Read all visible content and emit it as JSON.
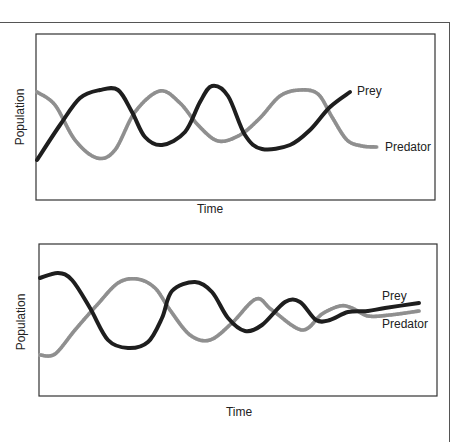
{
  "chart_data": [
    {
      "type": "line",
      "title": "",
      "xlabel": "Time",
      "ylabel": "Population",
      "grid": false,
      "legend": "inline-end-labels",
      "description": "Predator-prey cycles with constant amplitude oscillation",
      "series": [
        {
          "name": "Prey",
          "style": "solid-black",
          "points": [
            [
              37,
              160
            ],
            [
              60,
              125
            ],
            [
              80,
              98
            ],
            [
              100,
              90
            ],
            [
              118,
              90
            ],
            [
              132,
              112
            ],
            [
              145,
              137
            ],
            [
              162,
              145
            ],
            [
              185,
              132
            ],
            [
              200,
              102
            ],
            [
              212,
              86
            ],
            [
              228,
              96
            ],
            [
              245,
              135
            ],
            [
              262,
              149
            ],
            [
              290,
              145
            ],
            [
              310,
              130
            ],
            [
              330,
              107
            ],
            [
              350,
              92
            ]
          ]
        },
        {
          "name": "Predator",
          "style": "hatched-gray",
          "points": [
            [
              37,
              92
            ],
            [
              55,
              105
            ],
            [
              75,
              140
            ],
            [
              97,
              158
            ],
            [
              115,
              150
            ],
            [
              135,
              112
            ],
            [
              160,
              91
            ],
            [
              180,
              103
            ],
            [
              198,
              125
            ],
            [
              218,
              141
            ],
            [
              240,
              135
            ],
            [
              260,
              118
            ],
            [
              280,
              96
            ],
            [
              300,
              90
            ],
            [
              318,
              94
            ],
            [
              332,
              117
            ],
            [
              347,
              140
            ],
            [
              362,
              146
            ],
            [
              377,
              147
            ]
          ]
        }
      ],
      "labels": {
        "prey": {
          "text": "Prey",
          "x": 357,
          "y": 95
        },
        "predator": {
          "text": "Predator",
          "x": 385,
          "y": 151
        }
      },
      "box": {
        "x": 36,
        "y": 34,
        "w": 399,
        "h": 166
      },
      "xlabel_pos": {
        "x": 210,
        "y": 213
      },
      "ylabel_pos": {
        "x": 24,
        "y": 117
      }
    },
    {
      "type": "line",
      "title": "",
      "xlabel": "Time",
      "ylabel": "Population",
      "grid": false,
      "legend": "inline-end-labels",
      "description": "Predator-prey cycles with damped oscillation converging to equilibrium",
      "series": [
        {
          "name": "Prey",
          "style": "solid-black",
          "points": [
            [
              40,
              278
            ],
            [
              58,
              273
            ],
            [
              72,
              280
            ],
            [
              90,
              308
            ],
            [
              108,
              340
            ],
            [
              128,
              348
            ],
            [
              148,
              342
            ],
            [
              162,
              318
            ],
            [
              172,
              291
            ],
            [
              195,
              282
            ],
            [
              212,
              292
            ],
            [
              228,
              318
            ],
            [
              245,
              331
            ],
            [
              262,
              325
            ],
            [
              285,
              302
            ],
            [
              300,
              302
            ],
            [
              316,
              320
            ],
            [
              330,
              320
            ],
            [
              348,
              312
            ],
            [
              368,
              311
            ],
            [
              385,
              308
            ],
            [
              419,
              303
            ]
          ]
        },
        {
          "name": "Predator",
          "style": "hatched-gray",
          "points": [
            [
              40,
              355
            ],
            [
              55,
              354
            ],
            [
              75,
              330
            ],
            [
              97,
              305
            ],
            [
              118,
              283
            ],
            [
              137,
              279
            ],
            [
              155,
              288
            ],
            [
              170,
              310
            ],
            [
              190,
              335
            ],
            [
              210,
              340
            ],
            [
              232,
              323
            ],
            [
              256,
              299
            ],
            [
              272,
              310
            ],
            [
              302,
              330
            ],
            [
              322,
              314
            ],
            [
              340,
              306
            ],
            [
              352,
              308
            ],
            [
              368,
              316
            ],
            [
              390,
              315
            ],
            [
              419,
              311
            ]
          ]
        }
      ],
      "labels": {
        "prey": {
          "text": "Prey",
          "x": 382,
          "y": 300
        },
        "predator": {
          "text": "Predator",
          "x": 382,
          "y": 328
        }
      },
      "box": {
        "x": 39,
        "y": 244,
        "w": 398,
        "h": 152
      },
      "xlabel_pos": {
        "x": 239,
        "y": 416
      },
      "ylabel_pos": {
        "x": 25,
        "y": 322
      }
    }
  ]
}
